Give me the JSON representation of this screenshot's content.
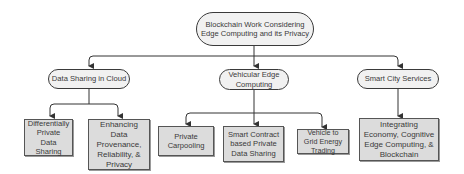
{
  "diagram": {
    "type": "hierarchy",
    "root": {
      "id": "root",
      "label": "Blockchain Work Considering Edge Computing and its Privacy"
    },
    "categories": [
      {
        "id": "cloud",
        "label": "Data Sharing in Cloud",
        "children": [
          {
            "id": "dp",
            "label": "Differentially Private Data Sharing"
          },
          {
            "id": "prov",
            "label": "Enhancing Data Provenance, Reliability, & Privacy"
          }
        ]
      },
      {
        "id": "vec",
        "label": "Vehicular Edge Computing",
        "children": [
          {
            "id": "carpool",
            "label": "Private Carpooling"
          },
          {
            "id": "smart",
            "label": "Smart Contract based Private Data Sharing"
          },
          {
            "id": "v2g",
            "label": "Vehicle to Grid Energy Trading"
          }
        ]
      },
      {
        "id": "city",
        "label": "Smart City Services",
        "children": [
          {
            "id": "econ",
            "label": "Integrating Economy, Cognitive Edge Computing, & Blockchain"
          }
        ]
      }
    ],
    "colors": {
      "pill_fill": "#f1f1f1",
      "box_fill": "#dcdcdc",
      "stroke": "#3a3a3a"
    }
  }
}
